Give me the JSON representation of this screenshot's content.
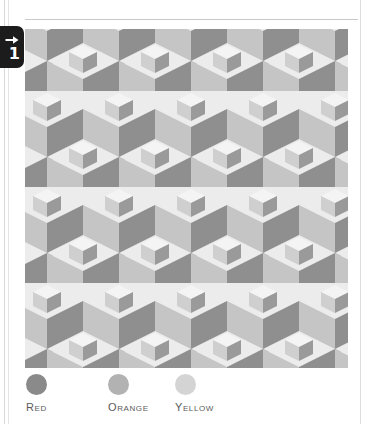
{
  "page": {
    "background": "#ffffff",
    "margin_rule_color": "#d9d9d9"
  },
  "step_badge": {
    "arrow_icon": "arrow-right-icon",
    "number": "1",
    "background": "#1c1c1c",
    "foreground": "#ffffff"
  },
  "figure": {
    "name": "isometric-cube-tessellation",
    "background": "#ededed",
    "palette": {
      "light": "#ececec",
      "medium": "#c5c5c5",
      "dark": "#8f8f8f",
      "small_light": "#f4f4f4",
      "small_medium": "#cfcfcf",
      "small_dark": "#9a9a9a"
    },
    "tile": {
      "width": 72,
      "height": 96,
      "columns": 5,
      "rows": 4
    }
  },
  "legend": {
    "items": [
      {
        "label": "Red",
        "color": "#8a8a8a"
      },
      {
        "label": "Orange",
        "color": "#b2b2b2"
      },
      {
        "label": "Yellow",
        "color": "#d4d4d4"
      }
    ]
  }
}
